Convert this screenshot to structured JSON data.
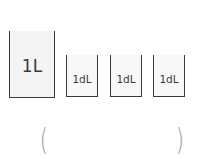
{
  "diagram": {
    "containers": [
      {
        "label": "1L",
        "size": "large"
      },
      {
        "label": "1dL",
        "size": "small"
      },
      {
        "label": "1dL",
        "size": "small"
      },
      {
        "label": "1dL",
        "size": "small"
      }
    ],
    "answer": {
      "open_paren": "(",
      "value": "",
      "close_paren": ")"
    }
  }
}
